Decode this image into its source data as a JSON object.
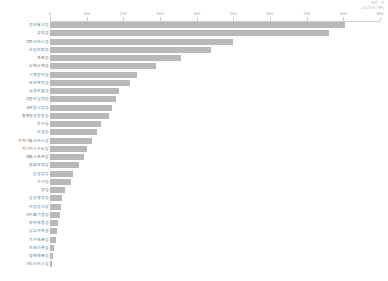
{
  "corner_note": {
    "line1": "단위 : 건",
    "line2": "(2023년 기준)"
  },
  "chart_data": {
    "type": "bar",
    "orientation": "horizontal",
    "title": "",
    "subtitle": "",
    "xlabel": "",
    "ylabel": "",
    "xlim": [
      0,
      900
    ],
    "xticks": [
      0,
      100,
      200,
      300,
      400,
      500,
      600,
      700,
      800,
      900
    ],
    "xtick_labels": [
      "0",
      "100",
      "200",
      "300",
      "400",
      "500",
      "600",
      "700",
      "800",
      "900"
    ],
    "grid": false,
    "legend": false,
    "bar_color": "#b9b9b9",
    "axis_color": "#cfcfcf",
    "label_color": "#6f6f6f",
    "sorted": "descending",
    "categories": [
      "정보통신업",
      "교육업",
      "전문서비스업",
      "사업지원업",
      "제조업",
      "도매소매업",
      "기계장비업",
      "보건복지업",
      "금융보험업",
      "부동산임대업",
      "숙박음식점업",
      "출판영상방송업",
      "운수업",
      "건설업",
      "과학기술서비스업",
      "전기가스수도업",
      "예술스포츠업",
      "협회단체업",
      "농업임업",
      "수리업",
      "광업",
      "공공행정업",
      "어업양식업",
      "하수폐기물업",
      "화학제품업",
      "섬유의복업",
      "가구제조업",
      "인쇄기록업",
      "담배제조업",
      "기타서비스업"
    ],
    "values": [
      805,
      760,
      500,
      440,
      358,
      290,
      238,
      218,
      188,
      180,
      170,
      160,
      138,
      128,
      115,
      100,
      92,
      78,
      62,
      58,
      40,
      34,
      30,
      26,
      22,
      18,
      15,
      12,
      8,
      5
    ]
  }
}
